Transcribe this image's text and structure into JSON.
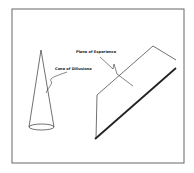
{
  "diagram": {
    "frame": {
      "x": 12,
      "y": 9,
      "width": 172,
      "height": 154,
      "stroke": "#555555"
    },
    "labels": {
      "cone": "Cone of Dillusiona",
      "plane": "Plane of Experience"
    },
    "colors": {
      "ink": "#222222",
      "background": "#ffffff"
    }
  }
}
